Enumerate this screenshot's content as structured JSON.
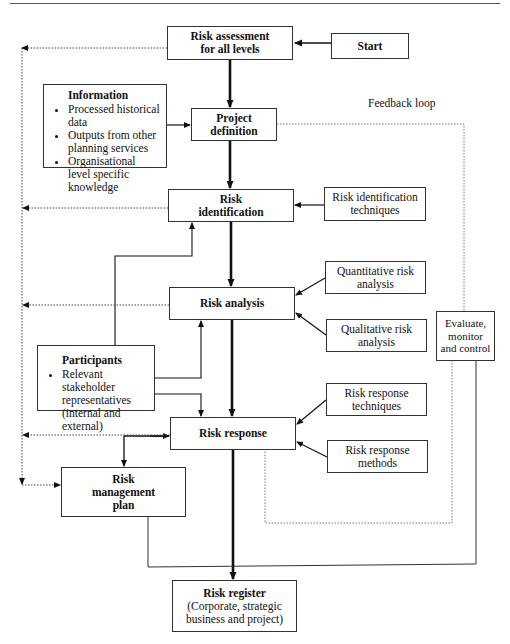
{
  "diagram": {
    "feedback_label": "Feedback loop",
    "nodes": {
      "start": {
        "label": "Start"
      },
      "risk_assessment": {
        "line1": "Risk assessment",
        "line2": "for all levels"
      },
      "information": {
        "title": "Information",
        "items": [
          "Processed historical data",
          "Outputs from other planning services",
          "Organisational level specific knowledge"
        ]
      },
      "project_definition": {
        "line1": "Project",
        "line2": "definition"
      },
      "risk_identification": {
        "line1": "Risk",
        "line2": "identification"
      },
      "risk_identification_techniques": {
        "line1": "Risk identification",
        "line2": "techniques"
      },
      "quantitative": {
        "line1": "Quantitative risk",
        "line2": "analysis"
      },
      "risk_analysis": {
        "label": "Risk analysis"
      },
      "qualitative": {
        "line1": "Qualitative risk",
        "line2": "analysis"
      },
      "evaluate": {
        "line1": "Evaluate,",
        "line2": "monitor",
        "line3": "and control"
      },
      "participants": {
        "title": "Participants",
        "items": [
          "Relevant stakeholder representatives (internal and external)"
        ]
      },
      "risk_response_techniques": {
        "line1": "Risk response",
        "line2": "techniques"
      },
      "risk_response": {
        "label": "Risk response"
      },
      "risk_response_methods": {
        "line1": "Risk response",
        "line2": "methods"
      },
      "risk_management_plan": {
        "line1": "Risk",
        "line2": "management",
        "line3": "plan"
      },
      "risk_register": {
        "title": "Risk register",
        "line1": "(Corporate, strategic",
        "line2": "business and project)"
      }
    },
    "edges": [
      {
        "from": "start",
        "to": "risk_assessment",
        "style": "solid"
      },
      {
        "from": "risk_assessment",
        "to": "project_definition",
        "style": "thick"
      },
      {
        "from": "information",
        "to": "project_definition",
        "style": "solid"
      },
      {
        "from": "project_definition",
        "to": "risk_identification",
        "style": "thick"
      },
      {
        "from": "risk_identification_techniques",
        "to": "risk_identification",
        "style": "solid"
      },
      {
        "from": "risk_identification",
        "to": "risk_analysis",
        "style": "thick"
      },
      {
        "from": "quantitative",
        "to": "risk_analysis",
        "style": "solid"
      },
      {
        "from": "qualitative",
        "to": "risk_analysis",
        "style": "solid"
      },
      {
        "from": "risk_analysis",
        "to": "risk_response",
        "style": "thick"
      },
      {
        "from": "participants",
        "to": "risk_identification",
        "style": "solid"
      },
      {
        "from": "participants",
        "to": "risk_analysis",
        "style": "solid"
      },
      {
        "from": "participants",
        "to": "risk_response",
        "style": "solid"
      },
      {
        "from": "risk_response_techniques",
        "to": "risk_response",
        "style": "solid"
      },
      {
        "from": "risk_response_methods",
        "to": "risk_response",
        "style": "solid"
      },
      {
        "from": "risk_response",
        "to": "risk_management_plan",
        "style": "solid-bidirectional"
      },
      {
        "from": "risk_response",
        "to": "risk_register",
        "style": "thick"
      },
      {
        "from": "risk_management_plan",
        "to": "evaluate",
        "style": "solid"
      },
      {
        "from": "project_definition",
        "to": "evaluate",
        "style": "dotted",
        "label": "Feedback loop"
      },
      {
        "from": "evaluate",
        "to": "risk_response",
        "style": "dotted"
      },
      {
        "from": "risk_assessment",
        "to": "risk_management_plan",
        "style": "dotted"
      },
      {
        "from": "risk_identification",
        "to": "left_feedback",
        "style": "dotted"
      },
      {
        "from": "risk_analysis",
        "to": "left_feedback",
        "style": "dotted"
      },
      {
        "from": "risk_response",
        "to": "left_feedback",
        "style": "dotted"
      }
    ]
  },
  "colors": {
    "line": "#111111",
    "box_border": "#333333",
    "dotted": "#777777",
    "background": "#ffffff"
  }
}
